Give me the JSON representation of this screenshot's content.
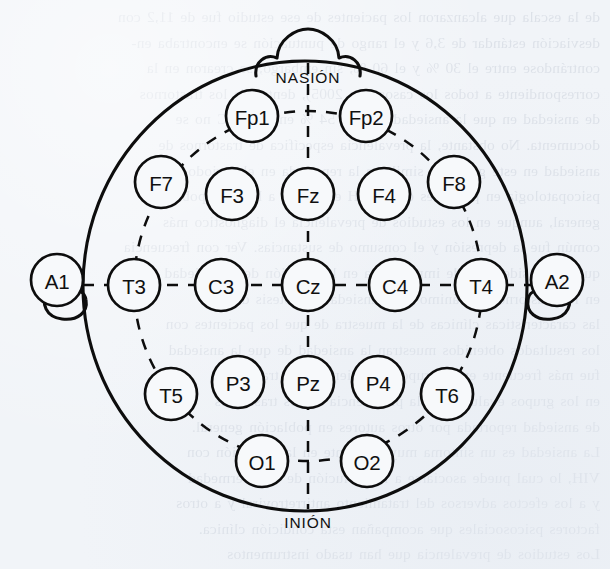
{
  "figure": {
    "kind": "eeg-10-20-electrode-placement-diagram",
    "orientation": "top-down view of head, nose at top",
    "ink_color": "#0d0d0d",
    "paper_color": "#f1f4f8"
  },
  "anatomy": {
    "nasion_label": "NASIÓN",
    "inion_label": "INIÓN",
    "nose": "nose-marker",
    "left_ear": "left-ear-marker",
    "right_ear": "right-ear-marker"
  },
  "electrodes": [
    {
      "id": "Fp1",
      "label": "Fp1",
      "cx": 252,
      "cy": 116,
      "r": 26,
      "row": "prefrontal",
      "side": "left"
    },
    {
      "id": "Fp2",
      "label": "Fp2",
      "cx": 366,
      "cy": 116,
      "r": 26,
      "row": "prefrontal",
      "side": "right"
    },
    {
      "id": "F7",
      "label": "F7",
      "cx": 161,
      "cy": 182,
      "r": 26,
      "row": "frontal",
      "side": "left"
    },
    {
      "id": "F3",
      "label": "F3",
      "cx": 232,
      "cy": 194,
      "r": 26,
      "row": "frontal",
      "side": "left"
    },
    {
      "id": "Fz",
      "label": "Fz",
      "cx": 308,
      "cy": 194,
      "r": 26,
      "row": "frontal",
      "side": "midline"
    },
    {
      "id": "F4",
      "label": "F4",
      "cx": 384,
      "cy": 194,
      "r": 26,
      "row": "frontal",
      "side": "right"
    },
    {
      "id": "F8",
      "label": "F8",
      "cx": 454,
      "cy": 182,
      "r": 26,
      "row": "frontal",
      "side": "right"
    },
    {
      "id": "A1",
      "label": "A1",
      "cx": 57,
      "cy": 280,
      "r": 26,
      "row": "reference",
      "side": "left"
    },
    {
      "id": "T3",
      "label": "T3",
      "cx": 134,
      "cy": 285,
      "r": 26,
      "row": "temporal-central",
      "side": "left"
    },
    {
      "id": "C3",
      "label": "C3",
      "cx": 221,
      "cy": 285,
      "r": 26,
      "row": "temporal-central",
      "side": "left"
    },
    {
      "id": "Cz",
      "label": "Cz",
      "cx": 308,
      "cy": 285,
      "r": 26,
      "row": "temporal-central",
      "side": "midline"
    },
    {
      "id": "C4",
      "label": "C4",
      "cx": 395,
      "cy": 285,
      "r": 26,
      "row": "temporal-central",
      "side": "right"
    },
    {
      "id": "T4",
      "label": "T4",
      "cx": 481,
      "cy": 285,
      "r": 26,
      "row": "temporal-central",
      "side": "right"
    },
    {
      "id": "A2",
      "label": "A2",
      "cx": 557,
      "cy": 280,
      "r": 26,
      "row": "reference",
      "side": "right"
    },
    {
      "id": "T5",
      "label": "T5",
      "cx": 171,
      "cy": 394,
      "r": 26,
      "row": "posterior-temporal-parietal",
      "side": "left"
    },
    {
      "id": "P3",
      "label": "P3",
      "cx": 238,
      "cy": 382,
      "r": 26,
      "row": "posterior-temporal-parietal",
      "side": "left"
    },
    {
      "id": "Pz",
      "label": "Pz",
      "cx": 308,
      "cy": 382,
      "r": 26,
      "row": "posterior-temporal-parietal",
      "side": "midline"
    },
    {
      "id": "P4",
      "label": "P4",
      "cx": 378,
      "cy": 382,
      "r": 26,
      "row": "posterior-temporal-parietal",
      "side": "right"
    },
    {
      "id": "T6",
      "label": "T6",
      "cx": 447,
      "cy": 394,
      "r": 26,
      "row": "posterior-temporal-parietal",
      "side": "right"
    },
    {
      "id": "O1",
      "label": "O1",
      "cx": 262,
      "cy": 461,
      "r": 26,
      "row": "occipital",
      "side": "left"
    },
    {
      "id": "O2",
      "label": "O2",
      "cx": 367,
      "cy": 461,
      "r": 26,
      "row": "occipital",
      "side": "right"
    }
  ],
  "bleed_text": "de la escala que alcanzaron los pacientes de ese estudio fue de 11,2 con\ndesviación estándar de 3,6 y el rango de puntuación se encontraba en-\ncontrándose entre el 30 % y el 60 %, sin embargo, se crearon en la\ncorrespondiente a todos los casos (Da 2005), dentro de los trastornos\nde ansiedad en que la ansiedad fue del 54 % en el VIHC no se\ndocumenta. No obstante, la prevalencia específica de trastornos de\nansiedad en este grupo es similar a la reportada en el periodo de la\npsicopatología en pacientes en el VIH es mayor a la de la población\ngeneral, aunque en los estudios de prevalencia el diagnóstico más\ncomún fue la depresión y el consumo de sustancias. Ver con frecuencia\nque se consideraban de importancia en la atención de la ansiedad\nen los trastornos del ánimo y de ansiedad, hipótesis de que\nlas características clínicas de la muestra de que los pacientes con\nlos resultados obtenidos muestran la ansiedad de que la ansiedad\nfue más frecuente en el grupo de pacientes con trastornos\nen los grupos evaluados y la prevalencia de los trastornos\nde ansiedad reportada por otros autores en población general.\nLa ansiedad es un síntoma muy frecuente en la población con\nVIH, lo cual puede asociarse a la evolución de la enfermedad\ny a los efectos adversos del tratamiento antirretroviral y a otros\nfactores psicosociales que acompañan esta condición clínica.\nLos estudios de prevalencia que han usado instrumentos\nestructurados que emplean los criterios estándar (DSM y CIE)\nse han reportado que la ansiedad es uno de los síntomas más\ncomunes en pacientes evaluados en el ámbito de consulta"
}
